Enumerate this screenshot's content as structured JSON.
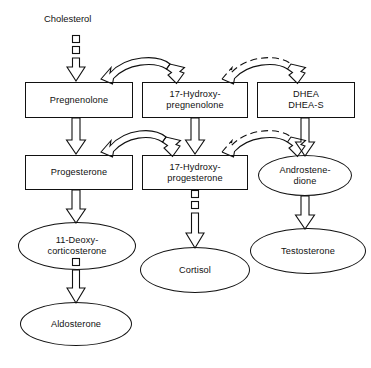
{
  "diagram": {
    "type": "flowchart",
    "background_color": "#ffffff",
    "stroke_color": "#111111",
    "width": 371,
    "height": 368
  },
  "labels": {
    "cholesterol": "Cholesterol"
  },
  "nodes": [
    {
      "id": "pregnenolone",
      "shape": "box",
      "line1": "Pregnenolone",
      "line2": ""
    },
    {
      "id": "17-hydroxy-pregnenolone",
      "shape": "box",
      "line1": "17-Hydroxy-",
      "line2": "pregnenolone"
    },
    {
      "id": "dhea",
      "shape": "box",
      "line1": "DHEA",
      "line2": "DHEA-S"
    },
    {
      "id": "progesterone",
      "shape": "box",
      "line1": "Progesterone",
      "line2": ""
    },
    {
      "id": "17-hydroxy-progesterone",
      "shape": "box",
      "line1": "17-Hydroxy-",
      "line2": "progesterone"
    },
    {
      "id": "androstenedione",
      "shape": "ellipse",
      "line1": "Androstene-",
      "line2": "dione"
    },
    {
      "id": "11-deoxycorticosterone",
      "shape": "ellipse",
      "line1": "11-Deoxy-",
      "line2": "corticosterone"
    },
    {
      "id": "cortisol",
      "shape": "ellipse",
      "line1": "Cortisol",
      "line2": ""
    },
    {
      "id": "testosterone",
      "shape": "ellipse",
      "line1": "Testosterone",
      "line2": ""
    },
    {
      "id": "aldosterone",
      "shape": "ellipse",
      "line1": "Aldosterone",
      "line2": ""
    }
  ],
  "edges": [
    {
      "id": "cholesterol-to-pregnenolone",
      "from": "cholesterol",
      "to": "pregnenolone",
      "style": "block-dashed-arrow",
      "direction": "down"
    },
    {
      "id": "pregnenolone-to-17-hydroxy-pregnenolone",
      "from": "pregnenolone",
      "to": "17-hydroxy-pregnenolone",
      "style": "curved-solid-arrow",
      "direction": "arch-right"
    },
    {
      "id": "17-hydroxy-pregnenolone-to-dhea",
      "from": "17-hydroxy-pregnenolone",
      "to": "dhea",
      "style": "curved-dashed-arrow",
      "direction": "arch-right"
    },
    {
      "id": "pregnenolone-to-progesterone",
      "from": "pregnenolone",
      "to": "progesterone",
      "style": "solid-arrow",
      "direction": "down"
    },
    {
      "id": "17-hydroxy-pregnenolone-to-17-hydroxy-progesterone",
      "from": "17-hydroxy-pregnenolone",
      "to": "17-hydroxy-progesterone",
      "style": "solid-arrow",
      "direction": "down"
    },
    {
      "id": "progesterone-to-17-hydroxy-progesterone",
      "from": "progesterone",
      "to": "17-hydroxy-progesterone",
      "style": "curved-solid-arrow",
      "direction": "arch-right"
    },
    {
      "id": "17-hydroxy-progesterone-to-androstenedione",
      "from": "17-hydroxy-progesterone",
      "to": "androstenedione",
      "style": "curved-dashed-arrow",
      "direction": "arch-right"
    },
    {
      "id": "dhea-to-androstenedione",
      "from": "dhea",
      "to": "androstenedione",
      "style": "solid-arrow",
      "direction": "down"
    },
    {
      "id": "progesterone-to-11-deoxycorticosterone",
      "from": "progesterone",
      "to": "11-deoxycorticosterone",
      "style": "solid-arrow",
      "direction": "down"
    },
    {
      "id": "17-hydroxy-progesterone-to-cortisol",
      "from": "17-hydroxy-progesterone",
      "to": "cortisol",
      "style": "block-dashed-arrow",
      "direction": "down"
    },
    {
      "id": "androstenedione-to-testosterone",
      "from": "androstenedione",
      "to": "testosterone",
      "style": "solid-arrow",
      "direction": "down"
    },
    {
      "id": "11-deoxycorticosterone-to-aldosterone",
      "from": "11-deoxycorticosterone",
      "to": "aldosterone",
      "style": "block-dashed-arrow",
      "direction": "down"
    }
  ]
}
